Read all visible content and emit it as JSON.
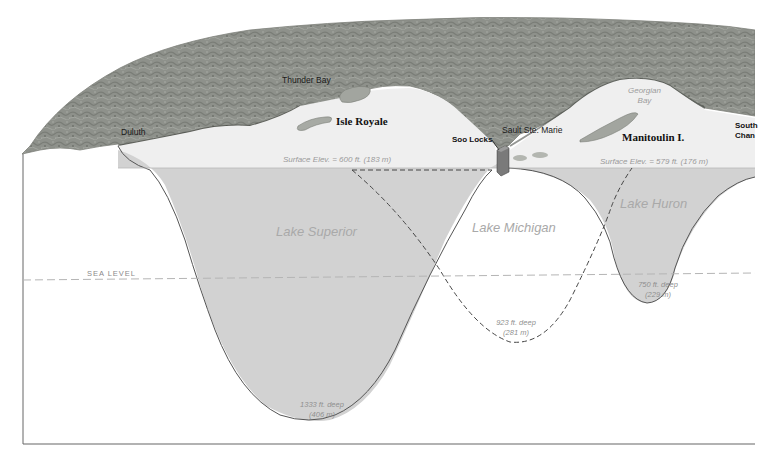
{
  "diagram": {
    "type": "cross-section",
    "colors": {
      "lake_fill": "#d2d2d2",
      "surface_plane": "#efefef",
      "terrain": "#8f928c",
      "outline": "#555555",
      "dashed_line": "#444444",
      "sea_level_line": "#b5b5b5"
    },
    "places": {
      "duluth": "Duluth",
      "thunder_bay": "Thunder Bay",
      "isle_royale": "Isle Royale",
      "soo_locks": "Soo Locks",
      "sault_ste_marie": "Sault Ste. Marie",
      "georgian_bay_line1": "Georgian",
      "georgian_bay_line2": "Bay",
      "manitoulin": "Manitoulin I.",
      "south_channel_line1": "South",
      "south_channel_line2": "Chan"
    },
    "elevations": {
      "superior_surface": "Surface Elev. = 600 ft. (183 m)",
      "huron_surface": "Surface Elev. = 579 ft. (176 m)"
    },
    "sea_level_label": "SEA  LEVEL",
    "lakes": [
      {
        "name": "Lake Superior",
        "depth_line1": "1333 ft. deep",
        "depth_line2": "(406 m)"
      },
      {
        "name": "Lake Michigan",
        "depth_line1": "923 ft. deep",
        "depth_line2": "(281 m)"
      },
      {
        "name": "Lake Huron",
        "depth_line1": "750 ft. deep",
        "depth_line2": "(229 m)"
      }
    ]
  }
}
